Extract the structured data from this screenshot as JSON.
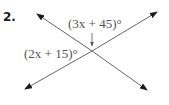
{
  "problem": {
    "number": "2."
  },
  "diagram": {
    "type": "intersecting-lines",
    "angle_labels": {
      "top": "(3x + 45)°",
      "left": "(2x + 15)°"
    },
    "colors": {
      "lines": "#555555",
      "arrowheads": "#1a1a1a",
      "text": "#555555"
    }
  }
}
